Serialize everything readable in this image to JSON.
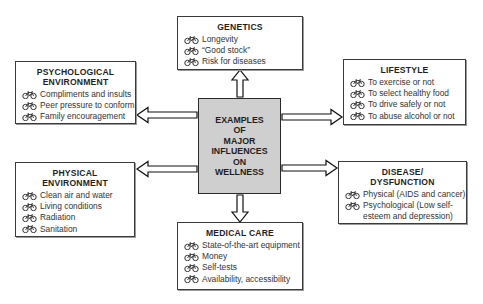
{
  "center": {
    "label": "EXAMPLES\nOF\nMAJOR\nINFLUENCES\nON\nWELLNESS"
  },
  "bullet_icon": "bicycle-icon",
  "boxes": {
    "genetics": {
      "title": "GENETICS",
      "items": [
        "Longevity",
        "“Good stock”",
        "Risk for diseases"
      ]
    },
    "psychological": {
      "title": "PSYCHOLOGICAL ENVIRONMENT",
      "title_line1": "PSYCHOLOGICAL",
      "title_line2": "ENVIRONMENT",
      "items": [
        "Compliments and insults",
        "Peer pressure to conform",
        "Family encouragement"
      ]
    },
    "lifestyle": {
      "title": "LIFESTYLE",
      "items": [
        "To exercise or not",
        "To select healthy food",
        "To drive safely or not",
        "To abuse alcohol or not"
      ]
    },
    "physical": {
      "title": "PHYSICAL ENVIRONMENT",
      "title_line1": "PHYSICAL",
      "title_line2": "ENVIRONMENT",
      "items": [
        "Clean air and water",
        "Living conditions",
        "Radiation",
        "Sanitation"
      ]
    },
    "disease": {
      "title": "DISEASE/ DYSFUNCTION",
      "title_line1": "DISEASE/",
      "title_line2": "DYSFUNCTION",
      "items": [
        "Physical (AIDS and cancer)",
        "Psychological (Low self-esteem and depression)"
      ]
    },
    "medical": {
      "title": "MEDICAL CARE",
      "items": [
        "State-of-the-art equipment",
        "Money",
        "Self-tests",
        "Availability, accessibility"
      ]
    }
  },
  "colors": {
    "center_fill": "#cfcfcf",
    "border": "#2a2a2a",
    "background": "#ffffff"
  }
}
